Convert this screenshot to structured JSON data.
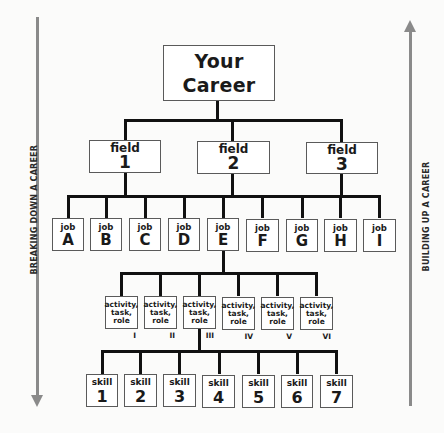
{
  "diagram": {
    "root": {
      "line1": "Your",
      "line2": "Career"
    },
    "fields": [
      {
        "label": "field",
        "id": "1"
      },
      {
        "label": "field",
        "id": "2"
      },
      {
        "label": "field",
        "id": "3"
      }
    ],
    "jobs": [
      {
        "label": "job",
        "id": "A"
      },
      {
        "label": "job",
        "id": "B"
      },
      {
        "label": "job",
        "id": "C"
      },
      {
        "label": "job",
        "id": "D"
      },
      {
        "label": "job",
        "id": "E"
      },
      {
        "label": "job",
        "id": "F"
      },
      {
        "label": "job",
        "id": "G"
      },
      {
        "label": "job",
        "id": "H"
      },
      {
        "label": "job",
        "id": "I"
      }
    ],
    "activities": [
      {
        "l1": "activity,",
        "l2": "task,",
        "l3": "role",
        "numeral": "I"
      },
      {
        "l1": "activity,",
        "l2": "task,",
        "l3": "role",
        "numeral": "II"
      },
      {
        "l1": "activity,",
        "l2": "task,",
        "l3": "role",
        "numeral": "III"
      },
      {
        "l1": "activity,",
        "l2": "task,",
        "l3": "role",
        "numeral": "IV"
      },
      {
        "l1": "activity,",
        "l2": "task,",
        "l3": "role",
        "numeral": "V"
      },
      {
        "l1": "activity,",
        "l2": "task,",
        "l3": "role",
        "numeral": "VI"
      }
    ],
    "skills": [
      {
        "label": "skill",
        "id": "1"
      },
      {
        "label": "skill",
        "id": "2"
      },
      {
        "label": "skill",
        "id": "3"
      },
      {
        "label": "skill",
        "id": "4"
      },
      {
        "label": "skill",
        "id": "5"
      },
      {
        "label": "skill",
        "id": "6"
      },
      {
        "label": "skill",
        "id": "7"
      }
    ],
    "left_arrow_label": "BREAKING DOWN A CAREER",
    "right_arrow_label": "BUILDING UP A CAREER",
    "colors": {
      "connector": "#111111",
      "arrow": "#8a8a8a",
      "box_border": "#5a5a5a",
      "background": "#fbfbfa"
    }
  }
}
